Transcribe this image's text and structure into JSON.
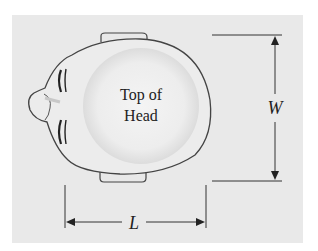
{
  "diagram": {
    "head_label_line1": "Top of",
    "head_label_line2": "Head",
    "width_label": "W",
    "length_label": "L",
    "colors": {
      "background": "#e9e9e9",
      "outline": "#444444",
      "head_fill": "#ececec",
      "text": "#222222"
    }
  }
}
